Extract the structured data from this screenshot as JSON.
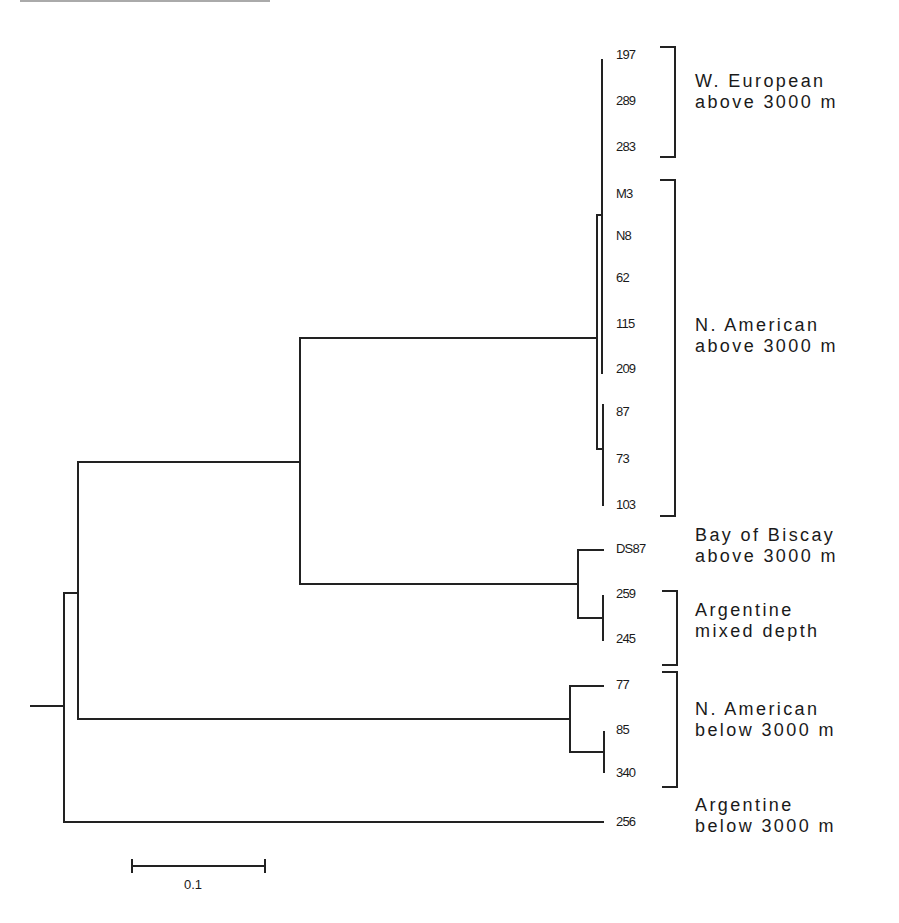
{
  "figure": {
    "type": "phylogenetic-tree",
    "scale_bar": {
      "label": "0.1"
    }
  },
  "tips": [
    {
      "label": "197",
      "y": 55
    },
    {
      "label": "289",
      "y": 101
    },
    {
      "label": "283",
      "y": 147
    },
    {
      "label": "M3",
      "y": 194
    },
    {
      "label": "N8",
      "y": 236
    },
    {
      "label": "62",
      "y": 278
    },
    {
      "label": "115",
      "y": 324
    },
    {
      "label": "209",
      "y": 369
    },
    {
      "label": "87",
      "y": 412
    },
    {
      "label": "73",
      "y": 459
    },
    {
      "label": "103",
      "y": 505
    },
    {
      "label": "DS87",
      "y": 549
    },
    {
      "label": "259",
      "y": 594
    },
    {
      "label": "245",
      "y": 639
    },
    {
      "label": "77",
      "y": 685
    },
    {
      "label": "85",
      "y": 730
    },
    {
      "label": "340",
      "y": 773
    },
    {
      "label": "256",
      "y": 822
    }
  ],
  "groups": [
    {
      "line1": "W. European",
      "line2": "above 3000 m",
      "members": [
        "197",
        "289",
        "283"
      ],
      "bracket": true
    },
    {
      "line1": "N. American",
      "line2": "above 3000 m",
      "members": [
        "M3",
        "N8",
        "62",
        "115",
        "209",
        "87",
        "73",
        "103"
      ],
      "bracket": true
    },
    {
      "line1": "Bay of Biscay",
      "line2": "above 3000 m",
      "members": [
        "DS87"
      ],
      "bracket": false
    },
    {
      "line1": "Argentine",
      "line2": "mixed depth",
      "members": [
        "259",
        "245"
      ],
      "bracket": true
    },
    {
      "line1": "N. American",
      "line2": "below 3000 m",
      "members": [
        "77",
        "85",
        "340"
      ],
      "bracket": true
    },
    {
      "line1": "Argentine",
      "line2": "below 3000 m",
      "members": [
        "256"
      ],
      "bracket": false
    }
  ]
}
